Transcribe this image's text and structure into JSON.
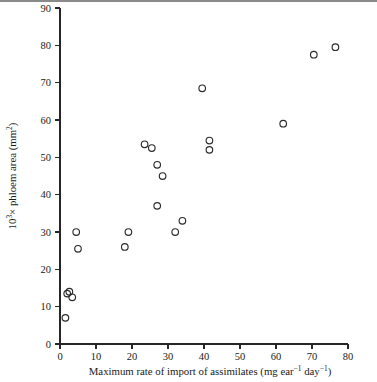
{
  "figure": {
    "background_color": "#ffffff",
    "marker_color": "#2b2b2b",
    "axis_color": "#262626",
    "top_rule_color": "#8a8a8a"
  },
  "axes": {
    "x": {
      "label_main": "Maximum rate of import of assimilates",
      "label_units_open": "(mg ear",
      "label_units_sup1": "−1",
      "label_units_mid": " day",
      "label_units_sup2": "−1",
      "label_units_close": ")",
      "ticks": [
        0,
        10,
        20,
        30,
        40,
        50,
        60,
        70,
        80
      ],
      "tick_labels": [
        "0",
        "10",
        "20",
        "30",
        "40",
        "50",
        "60",
        "70",
        "80"
      ],
      "min": 0,
      "max": 80
    },
    "y": {
      "label_prefix": "10",
      "label_exponent": "3",
      "label_main": "× phloem area (mm",
      "label_exponent2": "2",
      "label_suffix": ")",
      "ticks": [
        0,
        10,
        20,
        30,
        40,
        50,
        60,
        70,
        80,
        90
      ],
      "tick_labels": [
        "0",
        "10",
        "20",
        "30",
        "40",
        "50",
        "60",
        "70",
        "80",
        "90"
      ],
      "min": 0,
      "max": 90
    }
  },
  "chart_data": {
    "type": "scatter",
    "title": "",
    "xlabel": "Maximum rate of import of assimilates (mg ear⁻¹ day⁻¹)",
    "ylabel": "10³× phloem area (mm²)",
    "xlim": [
      0,
      80
    ],
    "ylim": [
      0,
      90
    ],
    "grid": false,
    "legend": null,
    "marker_style": "open-circle",
    "series": [
      {
        "name": "phloem area vs import rate",
        "points": [
          {
            "x": 1.5,
            "y": 7.0
          },
          {
            "x": 2.0,
            "y": 13.5
          },
          {
            "x": 2.6,
            "y": 14.0
          },
          {
            "x": 3.4,
            "y": 12.5
          },
          {
            "x": 4.5,
            "y": 30.0
          },
          {
            "x": 5.0,
            "y": 25.5
          },
          {
            "x": 18.0,
            "y": 26.0
          },
          {
            "x": 19.0,
            "y": 30.0
          },
          {
            "x": 23.5,
            "y": 53.5
          },
          {
            "x": 25.5,
            "y": 52.5
          },
          {
            "x": 27.0,
            "y": 48.0
          },
          {
            "x": 28.5,
            "y": 45.0
          },
          {
            "x": 27.0,
            "y": 37.0
          },
          {
            "x": 32.0,
            "y": 30.0
          },
          {
            "x": 34.0,
            "y": 33.0
          },
          {
            "x": 39.5,
            "y": 68.5
          },
          {
            "x": 41.5,
            "y": 54.5
          },
          {
            "x": 41.5,
            "y": 52.0
          },
          {
            "x": 62.0,
            "y": 59.0
          },
          {
            "x": 70.5,
            "y": 77.5
          },
          {
            "x": 76.5,
            "y": 79.5
          }
        ]
      }
    ]
  },
  "geometry": {
    "plot_left_px": 60,
    "plot_right_px": 348,
    "plot_bottom_px": 344,
    "plot_top_px": 8
  }
}
